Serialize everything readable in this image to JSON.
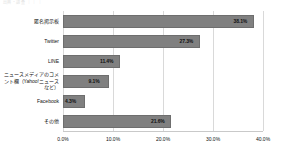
{
  "figure": {
    "header_note": "出典・調査  ｜ ｜ ｜",
    "background": "#ffffff",
    "bar_color": "#808080",
    "grid_color": "#d9d9d9"
  },
  "chart_data": {
    "type": "bar",
    "orientation": "horizontal",
    "title": "",
    "xlabel": "",
    "ylabel": "",
    "xlim": [
      0,
      40
    ],
    "xticks": [
      0,
      10,
      20,
      30,
      40
    ],
    "xticklabels": [
      "0.0%",
      "10.0%",
      "20.0%",
      "30.0%",
      "40.0%"
    ],
    "grid": true,
    "legend": false,
    "categories": [
      "匿名掲示板",
      "Twitter",
      "LINE",
      "ニュースメディアのコメント欄（Yahoo!ニュースなど）",
      "Facebook",
      "その他"
    ],
    "values": [
      38.1,
      27.3,
      11.4,
      9.1,
      4.3,
      21.6
    ],
    "value_labels": [
      "38.1%",
      "27.3%",
      "11.4%",
      "9.1%",
      "4.3%",
      "21.6%"
    ]
  }
}
